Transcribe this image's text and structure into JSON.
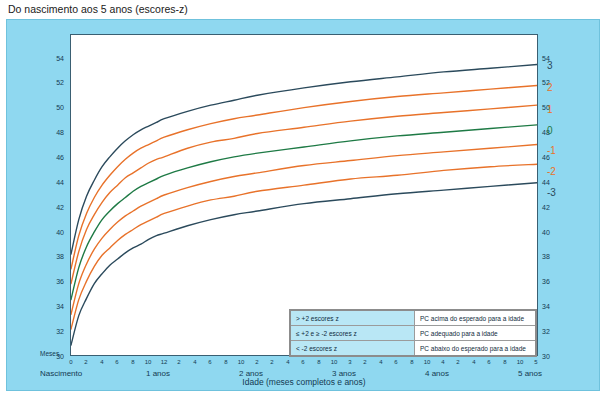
{
  "page": {
    "title": "Do nascimento aos 5 anos (escores-z)"
  },
  "chart_data": {
    "type": "line",
    "title": "Do nascimento aos 5 anos (escores-z)",
    "xlabel": "Idade (meses completos e anos)",
    "ylabel": "Perímetro Cefálico (cm)",
    "xlim": [
      0,
      60
    ],
    "ylim": [
      30,
      56
    ],
    "grid": false,
    "legend_position": "bottom-right",
    "x_unit_label": "Meses",
    "x_major_ticks": [
      {
        "value": 0,
        "label": "Nascimento"
      },
      {
        "value": 12,
        "label": "1 anos"
      },
      {
        "value": 24,
        "label": "2 anos"
      },
      {
        "value": 36,
        "label": "3 anos"
      },
      {
        "value": 48,
        "label": "4 anos"
      },
      {
        "value": 60,
        "label": "5 anos"
      }
    ],
    "x_minor_ticks": [
      0,
      2,
      4,
      6,
      8,
      10,
      12,
      2,
      4,
      6,
      8,
      10,
      24,
      2,
      4,
      6,
      8,
      10,
      36,
      2,
      4,
      6,
      8,
      10,
      48,
      2,
      4,
      6,
      8,
      10,
      60
    ],
    "x_minor_tick_labels": [
      "0",
      "2",
      "4",
      "6",
      "8",
      "10",
      "12",
      "2",
      "4",
      "6",
      "8",
      "10",
      "2",
      "2",
      "4",
      "6",
      "8",
      "10",
      "3",
      "2",
      "4",
      "6",
      "8",
      "10",
      "4",
      "2",
      "4",
      "6",
      "8",
      "10",
      "5"
    ],
    "y_ticks": [
      30,
      32,
      34,
      36,
      38,
      40,
      42,
      44,
      46,
      48,
      50,
      52,
      54
    ],
    "series": [
      {
        "name": "3",
        "color": "#2b4a5c",
        "label": "3",
        "points": [
          [
            0,
            38.2
          ],
          [
            1,
            41.0
          ],
          [
            2,
            42.9
          ],
          [
            3,
            44.2
          ],
          [
            4,
            45.3
          ],
          [
            5,
            46.1
          ],
          [
            6,
            46.8
          ],
          [
            7,
            47.4
          ],
          [
            8,
            47.9
          ],
          [
            9,
            48.3
          ],
          [
            10,
            48.6
          ],
          [
            11,
            48.9
          ],
          [
            12,
            49.2
          ],
          [
            15,
            49.8
          ],
          [
            18,
            50.3
          ],
          [
            21,
            50.7
          ],
          [
            24,
            51.1
          ],
          [
            30,
            51.7
          ],
          [
            36,
            52.2
          ],
          [
            42,
            52.6
          ],
          [
            48,
            53.0
          ],
          [
            54,
            53.3
          ],
          [
            60,
            53.6
          ]
        ]
      },
      {
        "name": "2",
        "color": "#e8722a",
        "label": "2",
        "points": [
          [
            0,
            37.0
          ],
          [
            1,
            39.7
          ],
          [
            2,
            41.5
          ],
          [
            3,
            42.8
          ],
          [
            4,
            43.8
          ],
          [
            5,
            44.6
          ],
          [
            6,
            45.3
          ],
          [
            7,
            45.9
          ],
          [
            8,
            46.4
          ],
          [
            9,
            46.8
          ],
          [
            10,
            47.1
          ],
          [
            11,
            47.4
          ],
          [
            12,
            47.7
          ],
          [
            15,
            48.3
          ],
          [
            18,
            48.8
          ],
          [
            21,
            49.2
          ],
          [
            24,
            49.5
          ],
          [
            30,
            50.1
          ],
          [
            36,
            50.6
          ],
          [
            42,
            51.0
          ],
          [
            48,
            51.3
          ],
          [
            54,
            51.6
          ],
          [
            60,
            51.9
          ]
        ]
      },
      {
        "name": "1",
        "color": "#e8722a",
        "label": "1",
        "points": [
          [
            0,
            35.8
          ],
          [
            1,
            38.4
          ],
          [
            2,
            40.2
          ],
          [
            3,
            41.4
          ],
          [
            4,
            42.4
          ],
          [
            5,
            43.2
          ],
          [
            6,
            43.8
          ],
          [
            7,
            44.4
          ],
          [
            8,
            44.8
          ],
          [
            9,
            45.2
          ],
          [
            10,
            45.6
          ],
          [
            11,
            45.9
          ],
          [
            12,
            46.1
          ],
          [
            15,
            46.8
          ],
          [
            18,
            47.3
          ],
          [
            21,
            47.6
          ],
          [
            24,
            48.0
          ],
          [
            30,
            48.5
          ],
          [
            36,
            49.0
          ],
          [
            42,
            49.4
          ],
          [
            48,
            49.7
          ],
          [
            54,
            50.0
          ],
          [
            60,
            50.3
          ]
        ]
      },
      {
        "name": "0",
        "color": "#1e7a45",
        "label": "0",
        "points": [
          [
            0,
            34.5
          ],
          [
            1,
            37.1
          ],
          [
            2,
            38.8
          ],
          [
            3,
            40.0
          ],
          [
            4,
            41.0
          ],
          [
            5,
            41.7
          ],
          [
            6,
            42.3
          ],
          [
            7,
            42.8
          ],
          [
            8,
            43.3
          ],
          [
            9,
            43.7
          ],
          [
            10,
            44.0
          ],
          [
            11,
            44.3
          ],
          [
            12,
            44.6
          ],
          [
            15,
            45.2
          ],
          [
            18,
            45.7
          ],
          [
            21,
            46.1
          ],
          [
            24,
            46.4
          ],
          [
            30,
            46.9
          ],
          [
            36,
            47.4
          ],
          [
            42,
            47.8
          ],
          [
            48,
            48.1
          ],
          [
            54,
            48.4
          ],
          [
            60,
            48.7
          ]
        ]
      },
      {
        "name": "-1",
        "color": "#e8722a",
        "label": "-1",
        "points": [
          [
            0,
            33.3
          ],
          [
            1,
            35.8
          ],
          [
            2,
            37.4
          ],
          [
            3,
            38.6
          ],
          [
            4,
            39.5
          ],
          [
            5,
            40.2
          ],
          [
            6,
            40.8
          ],
          [
            7,
            41.3
          ],
          [
            8,
            41.7
          ],
          [
            9,
            42.1
          ],
          [
            10,
            42.4
          ],
          [
            11,
            42.7
          ],
          [
            12,
            43.0
          ],
          [
            15,
            43.6
          ],
          [
            18,
            44.1
          ],
          [
            21,
            44.5
          ],
          [
            24,
            44.8
          ],
          [
            30,
            45.4
          ],
          [
            36,
            45.8
          ],
          [
            42,
            46.2
          ],
          [
            48,
            46.5
          ],
          [
            54,
            46.8
          ],
          [
            60,
            47.1
          ]
        ]
      },
      {
        "name": "-2",
        "color": "#e8722a",
        "label": "-2",
        "points": [
          [
            0,
            32.1
          ],
          [
            1,
            34.5
          ],
          [
            2,
            36.0
          ],
          [
            3,
            37.2
          ],
          [
            4,
            38.1
          ],
          [
            5,
            38.7
          ],
          [
            6,
            39.3
          ],
          [
            7,
            39.8
          ],
          [
            8,
            40.2
          ],
          [
            9,
            40.6
          ],
          [
            10,
            40.9
          ],
          [
            11,
            41.2
          ],
          [
            12,
            41.5
          ],
          [
            15,
            42.1
          ],
          [
            18,
            42.6
          ],
          [
            21,
            42.9
          ],
          [
            24,
            43.3
          ],
          [
            30,
            43.8
          ],
          [
            36,
            44.3
          ],
          [
            42,
            44.6
          ],
          [
            48,
            45.0
          ],
          [
            54,
            45.3
          ],
          [
            60,
            45.5
          ]
        ]
      },
      {
        "name": "-3",
        "color": "#2b4a5c",
        "label": "-3",
        "points": [
          [
            0,
            30.8
          ],
          [
            1,
            33.2
          ],
          [
            2,
            34.6
          ],
          [
            3,
            35.8
          ],
          [
            4,
            36.6
          ],
          [
            5,
            37.3
          ],
          [
            6,
            37.8
          ],
          [
            7,
            38.3
          ],
          [
            8,
            38.7
          ],
          [
            9,
            39.0
          ],
          [
            10,
            39.4
          ],
          [
            11,
            39.7
          ],
          [
            12,
            39.9
          ],
          [
            15,
            40.5
          ],
          [
            18,
            41.0
          ],
          [
            21,
            41.4
          ],
          [
            24,
            41.7
          ],
          [
            30,
            42.3
          ],
          [
            36,
            42.7
          ],
          [
            42,
            43.1
          ],
          [
            48,
            43.4
          ],
          [
            54,
            43.7
          ],
          [
            60,
            44.0
          ]
        ]
      }
    ],
    "legend": {
      "rows": [
        {
          "condition": "> +2 escores z",
          "meaning": "PC acima do esperado para a idade"
        },
        {
          "condition": "≤ +2 e ≥ -2 escores z",
          "meaning": "PC adequado para a idade"
        },
        {
          "condition": "< -2 escores z",
          "meaning": "PC abaixo do esperado para a idade"
        }
      ]
    },
    "colors": {
      "background": "#8fd8f0",
      "plot_background": "#ffffff",
      "axis": "#3a5f72",
      "dark_curve": "#2b4a5c",
      "orange_curve": "#e8722a",
      "green_curve": "#1e7a45",
      "legend_left_cell": "#b9e7f5"
    }
  }
}
